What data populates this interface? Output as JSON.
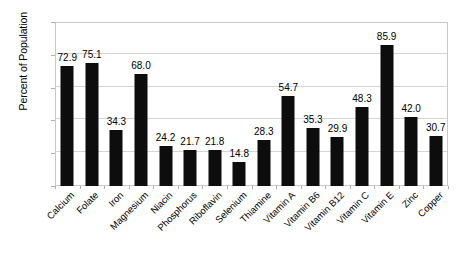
{
  "chart_data": {
    "type": "bar",
    "title": "",
    "subtitle": "",
    "xlabel": "",
    "ylabel": "Percent of Population",
    "ylim": [
      0,
      100
    ],
    "yticks": [
      0,
      20,
      40,
      60,
      80,
      100
    ],
    "ytick_labels": [
      "0",
      "20",
      "40",
      "60",
      "80",
      "100"
    ],
    "grid": true,
    "legend": false,
    "legend_position": "none",
    "bar_color": "#0d0d0d",
    "gridline_color": "#d5d5d5",
    "plot_border_color": "#c8c8c8",
    "background_color": "#ffffff",
    "x_label_rotation": -45,
    "show_value_labels": true,
    "categories": [
      "Calcium",
      "Folate",
      "Iron",
      "Magnesium",
      "Niacin",
      "Phosphorus",
      "Riboflavin",
      "Selenium",
      "Thiamine",
      "Vitamin A",
      "Vitamin B6",
      "Vitamin B12",
      "Vitamin C",
      "Vitamin E",
      "Zinc",
      "Copper"
    ],
    "values": [
      72.9,
      75.1,
      34.3,
      68.0,
      24.2,
      21.7,
      21.8,
      14.8,
      28.3,
      54.7,
      35.3,
      29.9,
      48.3,
      85.9,
      42.0,
      30.7
    ],
    "value_labels": [
      "72.9",
      "75.1",
      "34.3",
      "68.0",
      "24.2",
      "21.7",
      "21.8",
      "14.8",
      "28.3",
      "54.7",
      "35.3",
      "29.9",
      "48.3",
      "85.9",
      "42.0",
      "30.7"
    ]
  }
}
